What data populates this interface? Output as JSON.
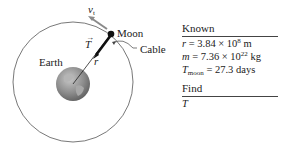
{
  "diagram": {
    "labels": {
      "velocity": "v",
      "velocity_sub": "t",
      "moon": "Moon",
      "cable": "Cable",
      "tension": "T",
      "radius": "r",
      "earth": "Earth"
    },
    "colors": {
      "orbit": "#555555",
      "cable": "#111111",
      "velocity_arrow": "#8a8a8a",
      "earth_ocean": "#7a7a7a",
      "earth_land": "#b0b0b0"
    }
  },
  "known_panel": {
    "known_header": "Known",
    "r_var": "r",
    "r_value": " = 3.84 × 10",
    "r_exp": "8",
    "r_unit": " m",
    "m_var": "m",
    "m_value": " = 7.36 × 10",
    "m_exp": "22",
    "m_unit": " kg",
    "t_var": "T",
    "t_sub": "moon",
    "t_value": " = 27.3 days",
    "find_header": "Find",
    "find_var": "T"
  }
}
